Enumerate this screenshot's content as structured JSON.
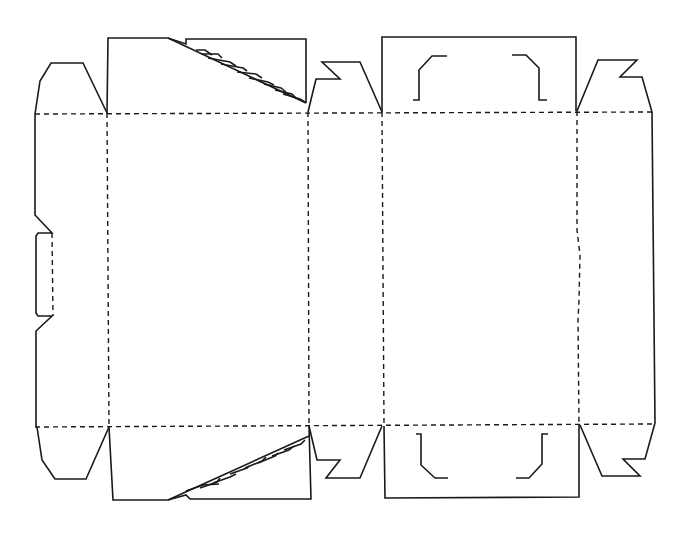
{
  "diagram": {
    "line_color": "#1a1a1a",
    "background": "#ffffff",
    "legend": {
      "cut_line": "solid",
      "fold_line": "dashed"
    },
    "panels": [
      {
        "name": "glue-flap-left",
        "x": [
          35,
          107
        ],
        "y": [
          113,
          426
        ]
      },
      {
        "name": "front-panel",
        "x": [
          107,
          308
        ],
        "y": [
          113,
          426
        ]
      },
      {
        "name": "side-panel-left",
        "x": [
          308,
          383
        ],
        "y": [
          113,
          426
        ]
      },
      {
        "name": "back-panel",
        "x": [
          383,
          577
        ],
        "y": [
          113,
          426
        ]
      },
      {
        "name": "side-panel-right",
        "x": [
          577,
          652
        ],
        "y": [
          113,
          426
        ]
      }
    ],
    "fold_lines": {
      "horizontal_y": [
        113,
        426
      ],
      "vertical_x": [
        107,
        308,
        383,
        577
      ]
    }
  }
}
